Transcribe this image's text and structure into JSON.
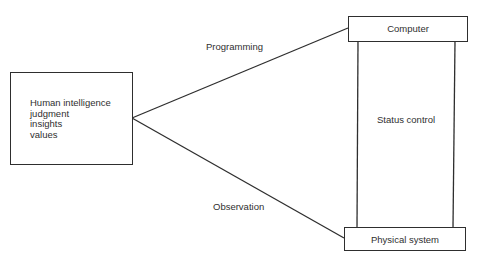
{
  "diagram": {
    "human_box": {
      "lines": [
        "Human intelligence",
        "judgment",
        "insights",
        "values"
      ]
    },
    "computer_box": {
      "label": "Computer"
    },
    "physical_box": {
      "label": "Physical system"
    },
    "status_box": {
      "label": "Status control"
    },
    "edges": {
      "programming": {
        "label": "Programming",
        "from": "human_box",
        "to": "computer_box"
      },
      "observation": {
        "label": "Observation",
        "from": "human_box",
        "to": "physical_box"
      }
    },
    "colors": {
      "line": "#2e2e2e",
      "text": "#2f2f2f",
      "background": "#ffffff"
    }
  }
}
